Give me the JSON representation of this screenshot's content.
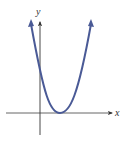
{
  "figure": {
    "type": "parabola-graph",
    "axes": {
      "x_label": "x",
      "y_label": "y",
      "axis_color": "#333333"
    },
    "curve": {
      "description": "upward-opening parabola, vertex on positive x-axis, positive y-intercept",
      "color": "#4a5a96",
      "vertex_px": [
        60,
        113
      ],
      "y_intercept_px": [
        40,
        70
      ]
    }
  }
}
